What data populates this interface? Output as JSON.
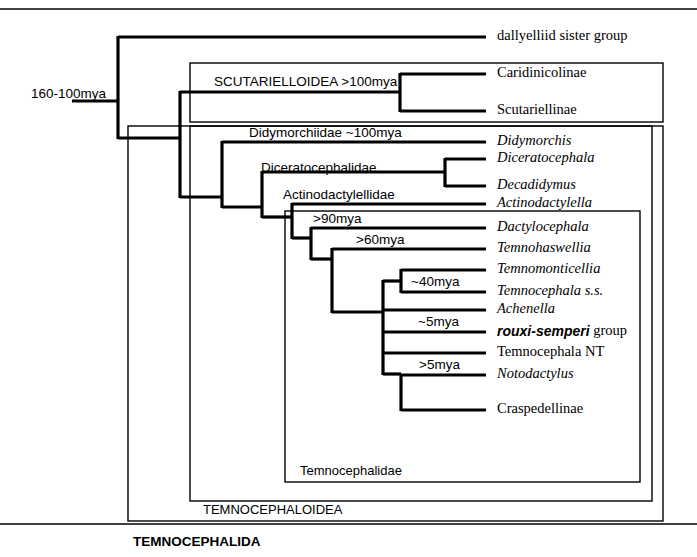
{
  "figure": {
    "type": "phylogenetic-cladogram",
    "root_age_label": "160-100mya"
  },
  "leaves": [
    {
      "id": "dallyelliid",
      "label": "dallyelliid sister group",
      "style": "roman",
      "y": 37,
      "tip_x": 490
    },
    {
      "id": "caridinicolinae",
      "label": "Caridinicolinae",
      "style": "roman",
      "y": 74,
      "tip_x": 490
    },
    {
      "id": "scutariellinae",
      "label": "Scutariellinae",
      "style": "roman",
      "y": 111,
      "tip_x": 490
    },
    {
      "id": "didymorchis",
      "label": "Didymorchis",
      "style": "italic",
      "y": 142,
      "tip_x": 490
    },
    {
      "id": "diceratocephala",
      "label": "Diceratocephala",
      "style": "italic",
      "y": 159,
      "tip_x": 490
    },
    {
      "id": "decadidymus",
      "label": "Decadidymus",
      "style": "italic",
      "y": 186,
      "tip_x": 490
    },
    {
      "id": "actinodactylella",
      "label": "Actinodactylella",
      "style": "italic",
      "y": 204,
      "tip_x": 490
    },
    {
      "id": "dactylocephala",
      "label": "Dactylocephala",
      "style": "italic",
      "y": 228,
      "tip_x": 490
    },
    {
      "id": "temnohaswellia",
      "label": "Temnohaswellia",
      "style": "italic",
      "y": 249,
      "tip_x": 490
    },
    {
      "id": "temnomonticellia",
      "label": "Temnomonticellia",
      "style": "italic",
      "y": 270,
      "tip_x": 490
    },
    {
      "id": "temnocephala_ss",
      "label": "Temnocephala s.s.",
      "style": "italic",
      "y": 292,
      "tip_x": 490
    },
    {
      "id": "achenella",
      "label": "Achenella",
      "style": "italic",
      "y": 310,
      "tip_x": 490
    },
    {
      "id": "rouxi_semperi",
      "label": "rouxi-semperi",
      "suffix": " group",
      "style": "sans-bold-italic",
      "y": 332,
      "tip_x": 490
    },
    {
      "id": "temnocephala_nt",
      "label": "Temnocephala NT",
      "style": "roman",
      "y": 353,
      "tip_x": 490
    },
    {
      "id": "notodactylus",
      "label": "Notodactylus",
      "style": "italic",
      "y": 375,
      "tip_x": 490
    },
    {
      "id": "craspedellinae",
      "label": "Craspedellinae",
      "style": "roman",
      "y": 410,
      "tip_x": 490
    }
  ],
  "clade_labels": [
    {
      "id": "scutarielloidea",
      "label": "SCUTARIELLOIDEA  >100mya",
      "x": 214,
      "y": 82
    },
    {
      "id": "didymorchiidae",
      "label": "Didymorchiidae   ~100mya",
      "x": 249,
      "y": 133
    },
    {
      "id": "diceratocephalidae",
      "label": "Diceratocephalidae",
      "x": 261,
      "y": 168
    },
    {
      "id": "actinodactylellidae",
      "label": "Actinodactylellidae",
      "x": 283,
      "y": 195
    },
    {
      "id": "age90",
      "label": ">90mya",
      "x": 313,
      "y": 219
    },
    {
      "id": "age60",
      "label": ">60mya",
      "x": 356,
      "y": 240
    },
    {
      "id": "age40",
      "label": "~40mya",
      "x": 411,
      "y": 282
    },
    {
      "id": "age5approx",
      "label": "~5mya",
      "x": 418,
      "y": 322
    },
    {
      "id": "age5greater",
      "label": ">5mya",
      "x": 419,
      "y": 365
    }
  ],
  "box_labels": [
    {
      "id": "temnocephalidae",
      "label": "Temnocephalidae",
      "x": 300,
      "y": 472,
      "bold": false
    },
    {
      "id": "temnocephaloidea",
      "label": "TEMNOCEPHALOIDEA",
      "x": 203,
      "y": 511,
      "bold": false
    },
    {
      "id": "temnocephalida",
      "label": "TEMNOCEPHALIDA",
      "x": 133,
      "y": 542,
      "bold": true
    }
  ],
  "boxes": [
    {
      "id": "scutarielloidea-box",
      "x": 190,
      "y": 63,
      "w": 473,
      "h": 59
    },
    {
      "id": "temnocephaloidea-box",
      "x": 128,
      "y": 126,
      "w": 535,
      "h": 395
    },
    {
      "id": "didymorchiidae-box",
      "x": 190,
      "y": 126,
      "w": 462,
      "h": 375
    },
    {
      "id": "temnocephalidae-box",
      "x": 285,
      "y": 211,
      "w": 355,
      "h": 271
    }
  ],
  "rules": [
    {
      "id": "top-rule",
      "x1": 0,
      "y1": 9,
      "x2": 697,
      "y2": 9
    },
    {
      "id": "bottom-rule",
      "x1": 0,
      "y1": 524,
      "x2": 697,
      "y2": 524
    }
  ],
  "colors": {
    "ink": "#000000",
    "background": "#ffffff"
  }
}
